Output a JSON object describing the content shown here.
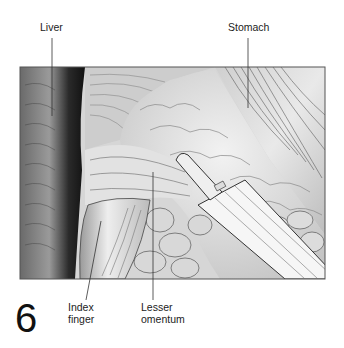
{
  "figure": {
    "number": "6",
    "colors": {
      "background": "#ffffff",
      "frame": "#555555",
      "liver_dark": "#2a2a2a",
      "tissue_light": "#e6e6e6",
      "tissue_mid": "#bdbdbd",
      "instrument": "#f4f4f4",
      "leader_line": "#333333"
    },
    "labels": [
      {
        "id": "liver",
        "text": "Liver"
      },
      {
        "id": "stomach",
        "text": "Stomach"
      },
      {
        "id": "index-finger",
        "text": "Index\nfinger"
      },
      {
        "id": "lesser-omentum",
        "text": "Lesser\nomentum"
      }
    ]
  }
}
